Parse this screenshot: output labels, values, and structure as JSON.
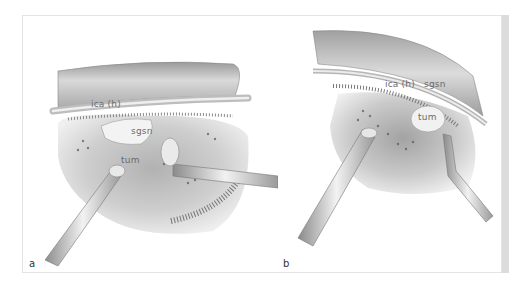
{
  "figure": {
    "panels": [
      {
        "label": "a",
        "annotations": {
          "ica": "ica (h)",
          "nerve": "sgsn",
          "tumor": "tum"
        }
      },
      {
        "label": "b",
        "annotations": {
          "ica": "ica (h)",
          "nerve": "sgsn",
          "tumor": "tum"
        }
      }
    ]
  },
  "colors": {
    "background": "#ffffff",
    "frame_border": "#e4e4e4",
    "side_strip": "#dcdcdc",
    "tissue": "#c8c8c8",
    "label_text": "#6b6b6b"
  }
}
